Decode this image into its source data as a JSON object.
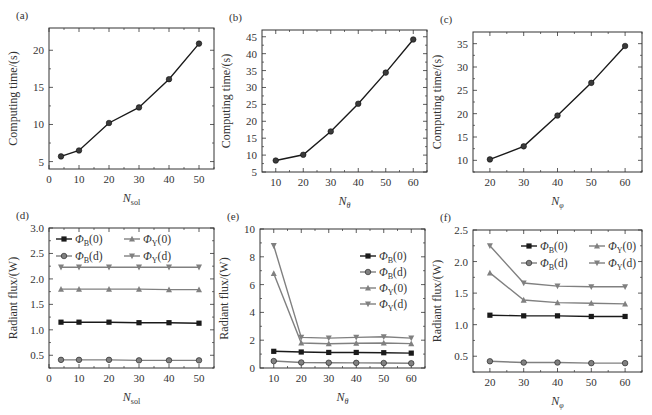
{
  "colors": {
    "dark": "#1a1a1a",
    "grey": "#808080",
    "axis": "#333333"
  },
  "chart_data": [
    {
      "panel": "(a)",
      "type": "line",
      "box": [
        49,
        28,
        214,
        169
      ],
      "xlabel": "N_sol",
      "xlabel_main": "N",
      "xlabel_sub": "sol",
      "ylabel": "Computing time/(s)",
      "xlim": [
        0,
        55
      ],
      "ylim": [
        4,
        23
      ],
      "xticks": [
        0,
        10,
        20,
        30,
        40,
        50
      ],
      "yticks": [
        5,
        10,
        15,
        20
      ],
      "grid": false,
      "legend": null,
      "series": [
        {
          "name": "Computing time",
          "color": "dark",
          "marker": "circle",
          "x": [
            4,
            10,
            20,
            30,
            40,
            50
          ],
          "y": [
            5.7,
            6.5,
            10.2,
            12.3,
            16.1,
            20.9
          ]
        }
      ]
    },
    {
      "panel": "(b)",
      "type": "line",
      "box": [
        262,
        30,
        427,
        172
      ],
      "xlabel": "N_θ",
      "xlabel_main": "N",
      "xlabel_sub": "θ",
      "ylabel": "Computing time/(s)",
      "xlim": [
        5,
        65
      ],
      "ylim": [
        5,
        47
      ],
      "xticks": [
        10,
        20,
        30,
        40,
        50,
        60
      ],
      "yticks": [
        5,
        10,
        15,
        20,
        25,
        30,
        35,
        40,
        45
      ],
      "grid": false,
      "legend": null,
      "series": [
        {
          "name": "Computing time",
          "color": "dark",
          "marker": "circle",
          "x": [
            10,
            20,
            30,
            40,
            50,
            60
          ],
          "y": [
            8.4,
            10.1,
            17.0,
            25.2,
            34.4,
            44.2
          ]
        }
      ]
    },
    {
      "panel": "(c)",
      "type": "line",
      "box": [
        473,
        32,
        642,
        172
      ],
      "xlabel": "N_φ",
      "xlabel_main": "N",
      "xlabel_sub": "φ",
      "ylabel": "Computing time/(s)",
      "xlim": [
        15,
        65
      ],
      "ylim": [
        7.5,
        37.5
      ],
      "xticks": [
        20,
        30,
        40,
        50,
        60
      ],
      "yticks": [
        10,
        15,
        20,
        25,
        30,
        35
      ],
      "grid": false,
      "legend": null,
      "series": [
        {
          "name": "Computing time",
          "color": "dark",
          "marker": "circle",
          "x": [
            20,
            30,
            40,
            50,
            60
          ],
          "y": [
            10.2,
            13.0,
            19.6,
            26.6,
            34.5
          ]
        }
      ]
    },
    {
      "panel": "(d)",
      "type": "line",
      "box": [
        49,
        228,
        214,
        368
      ],
      "xlabel": "N_sol",
      "xlabel_main": "N",
      "xlabel_sub": "sol",
      "ylabel": "Radiant flux/(W)",
      "xlim": [
        0,
        55
      ],
      "ylim": [
        0.25,
        3.0
      ],
      "xticks": [
        0,
        10,
        20,
        30,
        40,
        50
      ],
      "yticks": [
        0.5,
        1.0,
        1.5,
        2.0,
        2.5,
        3.0
      ],
      "ytick_labels": [
        "0.5",
        "1.0",
        "1.5",
        "2.0",
        "2.5",
        "3.0"
      ],
      "grid": false,
      "legend": {
        "position": "top",
        "layout": "2x2",
        "entries": [
          {
            "sym": "Φ",
            "sub": "B",
            "arg": "(0)",
            "series": 0,
            "col": 0,
            "row": 0
          },
          {
            "sym": "Φ",
            "sub": "Y",
            "arg": "(0)",
            "series": 2,
            "col": 1,
            "row": 0
          },
          {
            "sym": "Φ",
            "sub": "B",
            "arg": "(d)",
            "series": 1,
            "col": 0,
            "row": 1
          },
          {
            "sym": "Φ",
            "sub": "Y",
            "arg": "(d)",
            "series": 3,
            "col": 1,
            "row": 1
          }
        ],
        "anchor": [
          72,
          243
        ],
        "col_width": 68,
        "row_height": 17
      },
      "series": [
        {
          "name": "ΦB(0)",
          "color": "dark",
          "marker": "square",
          "x": [
            4,
            10,
            20,
            30,
            40,
            50
          ],
          "y": [
            1.15,
            1.15,
            1.15,
            1.14,
            1.14,
            1.13
          ]
        },
        {
          "name": "ΦB(d)",
          "color": "grey",
          "marker": "circle",
          "x": [
            4,
            10,
            20,
            30,
            40,
            50
          ],
          "y": [
            0.41,
            0.41,
            0.41,
            0.4,
            0.4,
            0.4
          ]
        },
        {
          "name": "ΦY(0)",
          "color": "grey",
          "marker": "triangle-up",
          "x": [
            4,
            10,
            20,
            30,
            40,
            50
          ],
          "y": [
            1.8,
            1.8,
            1.8,
            1.8,
            1.79,
            1.79
          ]
        },
        {
          "name": "ΦY(d)",
          "color": "grey",
          "marker": "triangle-down",
          "x": [
            4,
            10,
            20,
            30,
            40,
            50
          ],
          "y": [
            2.23,
            2.23,
            2.23,
            2.23,
            2.23,
            2.23
          ]
        }
      ]
    },
    {
      "panel": "(e)",
      "type": "line",
      "box": [
        260,
        229,
        425,
        368
      ],
      "xlabel": "N_θ",
      "xlabel_main": "N",
      "xlabel_sub": "θ",
      "ylabel": "Radiant flux/(W)",
      "xlim": [
        5,
        65
      ],
      "ylim": [
        0,
        10
      ],
      "xticks": [
        10,
        20,
        30,
        40,
        50,
        60
      ],
      "yticks": [
        0,
        2,
        4,
        6,
        8,
        10
      ],
      "grid": false,
      "legend": {
        "position": "right",
        "layout": "4x1",
        "entries": [
          {
            "sym": "Φ",
            "sub": "B",
            "arg": "(0)",
            "series": 0,
            "col": 0,
            "row": 0
          },
          {
            "sym": "Φ",
            "sub": "B",
            "arg": "(d)",
            "series": 1,
            "col": 0,
            "row": 1
          },
          {
            "sym": "Φ",
            "sub": "Y",
            "arg": "(0)",
            "series": 2,
            "col": 0,
            "row": 2
          },
          {
            "sym": "Φ",
            "sub": "Y",
            "arg": "(d)",
            "series": 3,
            "col": 0,
            "row": 3
          }
        ],
        "anchor": [
          376,
          260
        ],
        "col_width": 0,
        "row_height": 16
      },
      "series": [
        {
          "name": "ΦB(0)",
          "color": "dark",
          "marker": "square",
          "x": [
            10,
            20,
            30,
            40,
            50,
            60
          ],
          "y": [
            1.2,
            1.15,
            1.12,
            1.12,
            1.1,
            1.07
          ]
        },
        {
          "name": "ΦB(d)",
          "color": "grey",
          "marker": "circle",
          "x": [
            10,
            20,
            30,
            40,
            50,
            60
          ],
          "y": [
            0.5,
            0.4,
            0.38,
            0.37,
            0.36,
            0.34
          ]
        },
        {
          "name": "ΦY(0)",
          "color": "grey",
          "marker": "triangle-up",
          "x": [
            10,
            20,
            30,
            40,
            50,
            60
          ],
          "y": [
            6.8,
            1.8,
            1.75,
            1.78,
            1.8,
            1.75
          ]
        },
        {
          "name": "ΦY(d)",
          "color": "grey",
          "marker": "triangle-down",
          "x": [
            10,
            20,
            30,
            40,
            50,
            60
          ],
          "y": [
            8.8,
            2.2,
            2.15,
            2.2,
            2.25,
            2.15
          ]
        }
      ]
    },
    {
      "panel": "(f)",
      "type": "line",
      "box": [
        473,
        230,
        642,
        372
      ],
      "xlabel": "N_φ",
      "xlabel_main": "N",
      "xlabel_sub": "φ",
      "ylabel": "Radiant flux/(W)",
      "xlim": [
        15,
        65
      ],
      "ylim": [
        0.25,
        2.5
      ],
      "xticks": [
        20,
        30,
        40,
        50,
        60
      ],
      "yticks": [
        0.5,
        1.0,
        1.5,
        2.0,
        2.5
      ],
      "ytick_labels": [
        "0.5",
        "1.0",
        "1.5",
        "2.0",
        "2.5"
      ],
      "grid": false,
      "legend": {
        "position": "top",
        "layout": "2x2",
        "entries": [
          {
            "sym": "Φ",
            "sub": "B",
            "arg": "(0)",
            "series": 0,
            "col": 0,
            "row": 0
          },
          {
            "sym": "Φ",
            "sub": "Y",
            "arg": "(0)",
            "series": 2,
            "col": 1,
            "row": 0
          },
          {
            "sym": "Φ",
            "sub": "B",
            "arg": "(d)",
            "series": 1,
            "col": 0,
            "row": 1
          },
          {
            "sym": "Φ",
            "sub": "Y",
            "arg": "(d)",
            "series": 3,
            "col": 1,
            "row": 1
          }
        ],
        "anchor": [
          537,
          250
        ],
        "col_width": 68,
        "row_height": 17
      },
      "series": [
        {
          "name": "ΦB(0)",
          "color": "dark",
          "marker": "square",
          "x": [
            20,
            30,
            40,
            50,
            60
          ],
          "y": [
            1.15,
            1.14,
            1.14,
            1.13,
            1.13
          ]
        },
        {
          "name": "ΦB(d)",
          "color": "grey",
          "marker": "circle",
          "x": [
            20,
            30,
            40,
            50,
            60
          ],
          "y": [
            0.42,
            0.4,
            0.4,
            0.39,
            0.39
          ]
        },
        {
          "name": "ΦY(0)",
          "color": "grey",
          "marker": "triangle-up",
          "x": [
            20,
            30,
            40,
            50,
            60
          ],
          "y": [
            1.82,
            1.39,
            1.35,
            1.34,
            1.33
          ]
        },
        {
          "name": "ΦY(d)",
          "color": "grey",
          "marker": "triangle-down",
          "x": [
            20,
            30,
            40,
            50,
            60
          ],
          "y": [
            2.25,
            1.66,
            1.61,
            1.6,
            1.6
          ]
        }
      ]
    }
  ]
}
